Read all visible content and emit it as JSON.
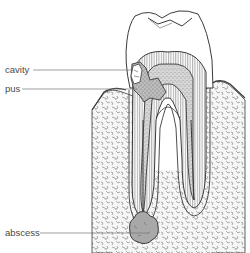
{
  "figure": {
    "labels": [
      {
        "id": "cavity",
        "text": "cavity",
        "x": 5,
        "y": 65,
        "line_x1": 33,
        "line_x2": 133,
        "line_y": 70
      },
      {
        "id": "pus",
        "text": "pus",
        "x": 5,
        "y": 84,
        "line_x1": 22,
        "line_x2": 137,
        "line_y": 89
      },
      {
        "id": "abscess",
        "text": "abscess",
        "x": 5,
        "y": 228,
        "line_x1": 40,
        "line_x2": 148,
        "line_y": 233
      }
    ],
    "colors": {
      "outline": "#3a3a3a",
      "line": "#777777",
      "decay_fill": "#b8b8b8",
      "abscess_fill": "#a8a8a8",
      "bone_fill": "#f4f4f4",
      "background": "#ffffff"
    }
  }
}
